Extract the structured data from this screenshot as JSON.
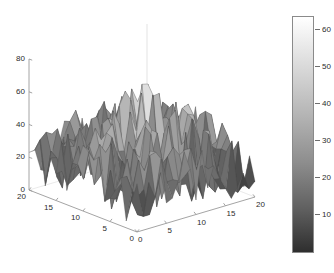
{
  "chart_data": {
    "type": "surface",
    "title": "",
    "xlabel": "",
    "ylabel": "",
    "zlabel": "",
    "grid": false,
    "legend": "none",
    "colormap": "gray",
    "shading": "faceted",
    "view": {
      "azimuth": -37.5,
      "elevation": 30
    },
    "axes": {
      "x": {
        "label": "",
        "ticks": [
          0,
          5,
          10,
          15,
          20
        ],
        "range": [
          0,
          20
        ]
      },
      "y": {
        "label": "",
        "ticks": [
          0,
          5,
          10,
          15,
          20
        ],
        "range": [
          0,
          20
        ]
      },
      "z": {
        "label": "",
        "ticks": [
          0,
          20,
          40,
          60,
          80
        ],
        "range": [
          0,
          80
        ]
      }
    },
    "colorbar": {
      "position": "right",
      "ticks": [
        10,
        20,
        30,
        40,
        50,
        60
      ],
      "range": [
        2,
        66
      ],
      "gradient_top_color": "#ffffff",
      "gradient_bottom_color": "#2e2e2e"
    },
    "grid_size": {
      "nx": 21,
      "ny": 21
    },
    "z_values_note": "Pseudo-random heights in range 0-66 generated from a fixed seed",
    "seed": 20250614,
    "z_min": 0,
    "z_max": 66
  },
  "colors": {
    "axis_line": "#9a9a9a",
    "tick_text": "#2b2b2b",
    "background": "#ffffff",
    "mesh_edge": "#4a4a4a"
  },
  "xtick_labels": [
    "0",
    "5",
    "10",
    "15",
    "20"
  ],
  "ytick_labels": [
    "20",
    "15",
    "10",
    "5",
    "0"
  ],
  "ztick_labels": [
    "80",
    "60",
    "40",
    "20",
    "0"
  ],
  "colorbar_labels": [
    "60",
    "50",
    "40",
    "30",
    "20",
    "10"
  ]
}
